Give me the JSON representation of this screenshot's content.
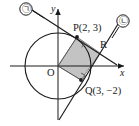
{
  "figure": {
    "type": "geometry-diagram",
    "background_color": "#ffffff",
    "stroke_color": "#1a1a1a",
    "fill_color": "#b8b8b8",
    "axes": {
      "x_label": "x",
      "y_label": "y",
      "origin_label": "O"
    },
    "points": [
      {
        "name": "P",
        "label": "P(2, 3)",
        "x": 2,
        "y": 3
      },
      {
        "name": "Q",
        "label": "Q(3, −2)",
        "x": 3,
        "y": -2
      },
      {
        "name": "R",
        "label": "R"
      },
      {
        "name": "O",
        "label": "O",
        "x": 0,
        "y": 0
      }
    ],
    "lines": [
      {
        "name": "line-1",
        "label": "㉠"
      },
      {
        "name": "line-2",
        "label": "㉡"
      }
    ],
    "right_angle_marks": [
      {
        "at": "P"
      },
      {
        "at": "Q"
      }
    ],
    "shaded_region": {
      "name": "quadrilateral-OPRQ",
      "vertices": [
        "O",
        "P",
        "R",
        "Q"
      ]
    }
  }
}
